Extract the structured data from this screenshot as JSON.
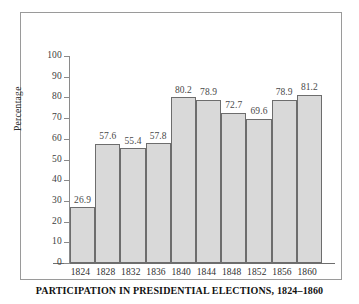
{
  "caption": "PARTICIPATION IN PRESIDENTIAL ELECTIONS, 1824–1860",
  "axis": {
    "y_title": "Percentage"
  },
  "colors": {
    "bar_fill": "#d9d9d9",
    "bar_stroke": "#6d6d6d",
    "frame": "#9a9a9a",
    "text": "#2e2e2e",
    "value_text": "#494949"
  },
  "chart_data": {
    "type": "bar",
    "title": "PARTICIPATION IN PRESIDENTIAL ELECTIONS, 1824–1860",
    "xlabel": "",
    "ylabel": "Percentage",
    "ylim": [
      0,
      100
    ],
    "yticks": [
      0,
      10,
      20,
      30,
      40,
      50,
      60,
      70,
      80,
      90,
      100
    ],
    "ytick_labels": [
      "0",
      "10",
      "20",
      "30",
      "40",
      "50",
      "60",
      "70",
      "80",
      "90",
      "100"
    ],
    "grid": false,
    "legend": null,
    "categories": [
      "1824",
      "1828",
      "1832",
      "1836",
      "1840",
      "1844",
      "1848",
      "1852",
      "1856",
      "1860"
    ],
    "values": [
      26.9,
      57.6,
      55.4,
      57.8,
      80.2,
      78.9,
      72.7,
      69.6,
      78.9,
      81.2
    ],
    "value_labels": [
      "26.9",
      "57.6",
      "55.4",
      "57.8",
      "80.2",
      "78.9",
      "72.7",
      "69.6",
      "78.9",
      "81.2"
    ]
  }
}
